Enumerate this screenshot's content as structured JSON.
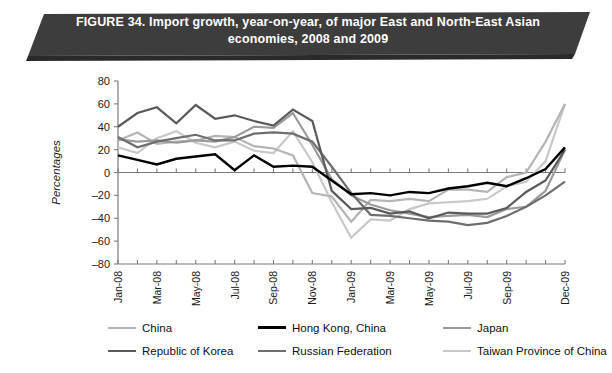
{
  "figure": {
    "banner_title": "FIGURE 34. Import growth, year-on-year, of major East and North-East Asian economies, 2008 and 2009",
    "banner_color": "#3d3d3d"
  },
  "chart_data": {
    "type": "line",
    "title": "FIGURE 34. Import growth, year-on-year, of major East and North-East Asian economies, 2008 and 2009",
    "xlabel": "",
    "ylabel": "Percentages",
    "ylim": [
      -80,
      80
    ],
    "ytick_step": 20,
    "yticks": [
      80,
      60,
      40,
      20,
      0,
      -20,
      -40,
      -60,
      -80
    ],
    "grid": false,
    "legend_position": "bottom",
    "x": [
      "Jan-08",
      "Feb-08",
      "Mar-08",
      "Apr-08",
      "May-08",
      "Jun-08",
      "Jul-08",
      "Aug-08",
      "Sep-08",
      "Oct-08",
      "Nov-08",
      "Dec-08",
      "Jan-09",
      "Feb-09",
      "Mar-09",
      "Apr-09",
      "May-09",
      "Jun-09",
      "Jul-09",
      "Aug-09",
      "Sep-09",
      "Oct-09",
      "Nov-09",
      "Dec-09"
    ],
    "xtick_labels": [
      "Jan-08",
      "Mar-08",
      "May-08",
      "Jul-08",
      "Sep-08",
      "Nov-08",
      "Jan-09",
      "Mar-09",
      "May-09",
      "Jul-09",
      "Sep-09",
      "Dec-09"
    ],
    "xtick_indices": [
      0,
      2,
      4,
      6,
      8,
      10,
      12,
      14,
      16,
      18,
      20,
      23
    ],
    "series": [
      {
        "name": "China",
        "color": "#b4b4b4",
        "width": 2.2,
        "values": [
          28,
          35,
          25,
          27,
          28,
          32,
          31,
          23,
          21,
          15,
          -18,
          -21,
          -43,
          -24,
          -25,
          -23,
          -25,
          -15,
          -15,
          -17,
          -4,
          0,
          27,
          60
        ]
      },
      {
        "name": "Hong Kong, China",
        "color": "#000000",
        "width": 2.4,
        "values": [
          15,
          11,
          7,
          12,
          14,
          16,
          2,
          15,
          5,
          6,
          5,
          -7,
          -19,
          -18,
          -20,
          -17,
          -18,
          -14,
          -12,
          -9,
          -12,
          -5,
          3,
          22
        ]
      },
      {
        "name": "Japan",
        "color": "#9a9a9a",
        "width": 2.2,
        "values": [
          29,
          27,
          28,
          26,
          28,
          27,
          31,
          40,
          39,
          52,
          24,
          -6,
          -20,
          -28,
          -33,
          -36,
          -39,
          -38,
          -37,
          -39,
          -32,
          -30,
          -16,
          20
        ]
      },
      {
        "name": "Republic of Korea",
        "color": "#5a5a5a",
        "width": 2.2,
        "values": [
          40,
          52,
          57,
          43,
          59,
          47,
          50,
          45,
          41,
          55,
          45,
          -16,
          -32,
          -31,
          -36,
          -34,
          -40,
          -35,
          -36,
          -36,
          -31,
          -17,
          -7,
          20
        ]
      },
      {
        "name": "Russian Federation",
        "color": "#6e6e6e",
        "width": 2.2,
        "values": [
          31,
          22,
          27,
          30,
          33,
          28,
          28,
          34,
          35,
          34,
          27,
          5,
          -18,
          -37,
          -38,
          -40,
          -42,
          -43,
          -46,
          -44,
          -38,
          -30,
          -20,
          -8
        ]
      },
      {
        "name": "Taiwan Province of China",
        "color": "#c8c8c8",
        "width": 2.2,
        "values": [
          22,
          17,
          30,
          36,
          26,
          22,
          27,
          19,
          17,
          36,
          9,
          -26,
          -57,
          -41,
          -42,
          -32,
          -27,
          -26,
          -25,
          -23,
          -12,
          -8,
          10,
          60
        ]
      }
    ]
  },
  "legend": {
    "items": [
      {
        "label": "China",
        "color": "#b4b4b4",
        "width": 2.4
      },
      {
        "label": "Hong Kong, China",
        "color": "#000000",
        "width": 3.2
      },
      {
        "label": "Japan",
        "color": "#9a9a9a",
        "width": 2.4
      },
      {
        "label": "Republic of Korea",
        "color": "#5a5a5a",
        "width": 2.6
      },
      {
        "label": "Russian Federation",
        "color": "#6e6e6e",
        "width": 2.6
      },
      {
        "label": "Taiwan Province of China",
        "color": "#c8c8c8",
        "width": 2.6
      }
    ]
  }
}
